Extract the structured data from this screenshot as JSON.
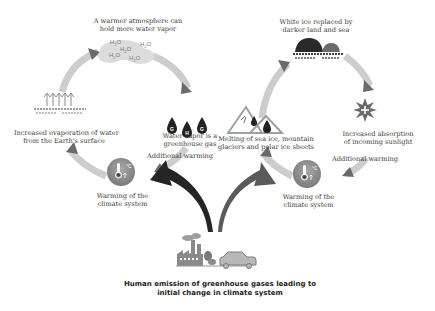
{
  "left_cycle": {
    "top_label": [
      "A warmer atmosphere can",
      "hold more water vapor"
    ],
    "h2o_labels": [
      "H2O",
      "H2O",
      "H2O",
      "H2O",
      "H2O"
    ],
    "left_label": [
      "Increased evaporation of water",
      "from the Earth's surface"
    ],
    "right_label": [
      "Water vapor is a",
      "greenhouse gas"
    ],
    "drop_letters": [
      "G",
      "H",
      "G"
    ],
    "additional_warming": "Additional warming",
    "bottom_label": [
      "Warming of the",
      "climate system"
    ],
    "thermometer_unit": "°C"
  },
  "right_cycle": {
    "top_label": [
      "White ice replaced by",
      "darker land and sea"
    ],
    "left_label": [
      "Melting of sea ice, mountain",
      "glaciers and polar ice sheets"
    ],
    "right_label": [
      "Increased absorption",
      "of incoming sunlight"
    ],
    "additional_warming": "Additional warming",
    "bottom_label": [
      "Warming of the",
      "climate system"
    ],
    "thermometer_unit": "°C"
  },
  "source": {
    "label": [
      "Human emission of greenhouse gases leading to",
      "initial change in climate system"
    ]
  },
  "colors": {
    "cycle_arrow": "#c8c8c8",
    "arrowhead": "#6a6a6a",
    "dark_arrow": "#2a2a2a",
    "gray_arrow": "#5a5a5a",
    "circle_icon": "#8a8a8a",
    "text": "#3a3a3a"
  }
}
